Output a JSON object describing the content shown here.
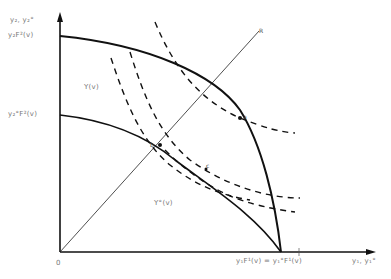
{
  "diagram": {
    "type": "production-possibility frontier diagram",
    "axes": {
      "y_label": "y₂, y₂°",
      "x_label": "y₁, y₁°",
      "origin_label": "0"
    },
    "y_axis_ticks": [
      {
        "label": "y₂F²(v)",
        "y": 36
      },
      {
        "label": "y₂°F²(v)",
        "y": 115
      }
    ],
    "x_axis_ticks": [
      {
        "label": "y₁F¹(v) = y₁°F¹(v)"
      }
    ],
    "regions": [
      {
        "label": "Y(v)"
      },
      {
        "label": "Y°(v)"
      }
    ],
    "ray": {
      "label": "R"
    },
    "points": [
      {
        "label": "a"
      },
      {
        "label": "b"
      },
      {
        "label": "c"
      }
    ],
    "colors": {
      "line": "#111111",
      "label": "#777777",
      "background": "#ffffff"
    }
  }
}
